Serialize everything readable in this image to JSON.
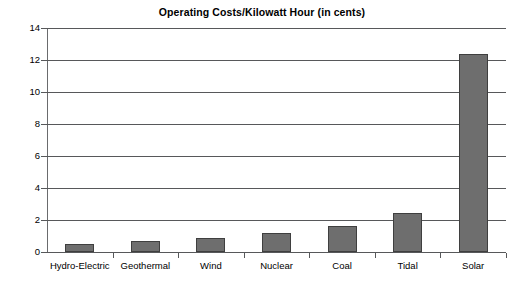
{
  "chart_data": {
    "type": "bar",
    "title": "Operating Costs/Kilowatt Hour (in cents)",
    "xlabel": "",
    "ylabel": "",
    "categories": [
      "Hydro-Electric",
      "Geothermal",
      "Wind",
      "Nuclear",
      "Coal",
      "Tidal",
      "Solar"
    ],
    "values": [
      0.5,
      0.7,
      0.9,
      1.2,
      1.6,
      2.45,
      12.4
    ],
    "ylim": [
      0,
      14
    ],
    "yticks": [
      0,
      2,
      4,
      6,
      8,
      10,
      12,
      14
    ],
    "ytick_labels": [
      "0",
      "2",
      "4",
      "6",
      "8",
      "10",
      "12",
      "14"
    ],
    "grid": true,
    "legend": false,
    "bar_color": "#6e6e6e",
    "bar_border_color": "#3f3f3f",
    "axis_color": "#57585a",
    "background_color": "#ffffff"
  }
}
